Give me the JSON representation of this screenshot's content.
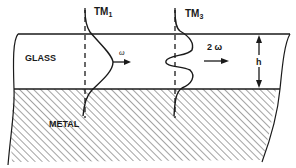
{
  "diagram": {
    "type": "waveguide mode profile schematic",
    "regions": {
      "glass": {
        "label": "GLASS"
      },
      "metal": {
        "label": "METAL"
      }
    },
    "modes": [
      {
        "name": "TM",
        "subscript": "1",
        "frequency_label": "ω"
      },
      {
        "name": "TM",
        "subscript": "3",
        "frequency_label": "2 ω"
      }
    ],
    "dimension": {
      "label": "h"
    },
    "colors": {
      "line": "#1a1a1a",
      "background": "#ffffff",
      "hatch": "#555555"
    }
  }
}
